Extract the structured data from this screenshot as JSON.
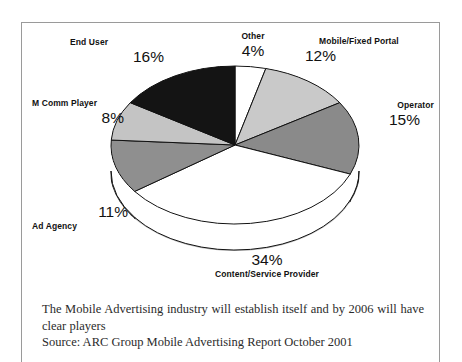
{
  "figure": {
    "caption_lead": "The Mobile Advertising industry will establish itself and by 2006 will have clear players",
    "caption_source": "Source: ARC Group Mobile Advertising Report October 2001"
  },
  "chart_data": {
    "type": "pie",
    "title": "",
    "xlabel": "",
    "ylabel": "",
    "unit": "%",
    "legend": "callout-labels",
    "grid": false,
    "start_angle_deg": 0,
    "direction": "clockwise",
    "categories": [
      "Other",
      "Mobile/Fixed Portal",
      "Operator",
      "Content/Service Provider",
      "Ad Agency",
      "M Comm Player",
      "End User"
    ],
    "values": [
      4,
      12,
      15,
      34,
      11,
      8,
      16
    ],
    "labels": [
      "4%",
      "12%",
      "15%",
      "34%",
      "11%",
      "8%",
      "16%"
    ],
    "colors": [
      "#ffffff",
      "#c9c9c9",
      "#8a8a8a",
      "#ffffff",
      "#8f8f8f",
      "#c4c4c4",
      "#141414"
    ],
    "side_colors": [
      "#b4b4b4",
      "#a8a8a8",
      "#3a3a3a",
      "#bdbdbd",
      "#1c1c1c",
      "#9a9a9a",
      "#0d0d0d"
    ],
    "slices": [
      {
        "name": "Other",
        "value": 4,
        "label": "4%",
        "color": "#ffffff"
      },
      {
        "name": "Mobile/Fixed Portal",
        "value": 12,
        "label": "12%",
        "color": "#c9c9c9"
      },
      {
        "name": "Operator",
        "value": 15,
        "label": "15%",
        "color": "#8a8a8a"
      },
      {
        "name": "Content/Service Provider",
        "value": 34,
        "label": "34%",
        "color": "#ffffff"
      },
      {
        "name": "Ad Agency",
        "value": 11,
        "label": "11%",
        "color": "#8f8f8f"
      },
      {
        "name": "M Comm Player",
        "value": 8,
        "label": "8%",
        "color": "#c4c4c4"
      },
      {
        "name": "End User",
        "value": 16,
        "label": "16%",
        "color": "#141414"
      }
    ]
  }
}
